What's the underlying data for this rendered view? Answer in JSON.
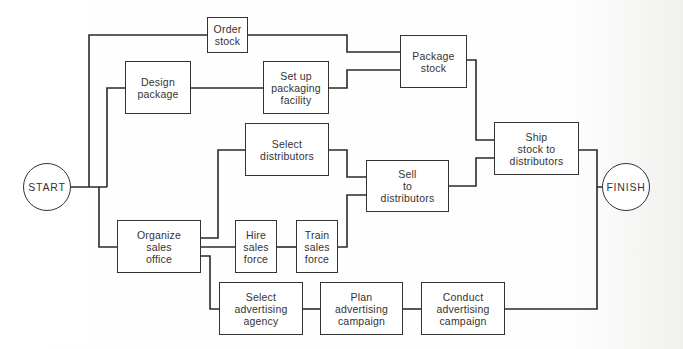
{
  "diagram": {
    "type": "network-diagram",
    "start": {
      "label": "START"
    },
    "finish": {
      "label": "FINISH"
    },
    "nodes": [
      {
        "id": "order-stock",
        "label": "Order\nstock"
      },
      {
        "id": "design-package",
        "label": "Design\npackage"
      },
      {
        "id": "setup-packaging",
        "label": "Set up\npackaging\nfacility"
      },
      {
        "id": "package-stock",
        "label": "Package\nstock"
      },
      {
        "id": "select-distributors",
        "label": "Select\ndistributors"
      },
      {
        "id": "sell-distributors",
        "label": "Sell\nto\ndistributors"
      },
      {
        "id": "ship-stock",
        "label": "Ship\nstock to\ndistributors"
      },
      {
        "id": "organize-sales",
        "label": "Organize\nsales\noffice"
      },
      {
        "id": "hire-sales",
        "label": "Hire\nsales\nforce"
      },
      {
        "id": "train-sales",
        "label": "Train\nsales\nforce"
      },
      {
        "id": "select-agency",
        "label": "Select\nadvertising\nagency"
      },
      {
        "id": "plan-campaign",
        "label": "Plan\nadvertising\ncampaign"
      },
      {
        "id": "conduct-campaign",
        "label": "Conduct\nadvertising\ncampaign"
      }
    ],
    "edges": [
      [
        "START",
        "order-stock"
      ],
      [
        "START",
        "design-package"
      ],
      [
        "START",
        "organize-sales"
      ],
      [
        "order-stock",
        "package-stock"
      ],
      [
        "design-package",
        "setup-packaging"
      ],
      [
        "setup-packaging",
        "package-stock"
      ],
      [
        "package-stock",
        "ship-stock"
      ],
      [
        "organize-sales",
        "select-distributors"
      ],
      [
        "organize-sales",
        "hire-sales"
      ],
      [
        "organize-sales",
        "select-agency"
      ],
      [
        "hire-sales",
        "train-sales"
      ],
      [
        "select-distributors",
        "sell-distributors"
      ],
      [
        "train-sales",
        "sell-distributors"
      ],
      [
        "sell-distributors",
        "ship-stock"
      ],
      [
        "ship-stock",
        "FINISH"
      ],
      [
        "select-agency",
        "plan-campaign"
      ],
      [
        "plan-campaign",
        "conduct-campaign"
      ],
      [
        "conduct-campaign",
        "FINISH"
      ]
    ],
    "colors": {
      "line": "#2a2a2a",
      "box_border": "#333333",
      "text": "#333333"
    }
  }
}
